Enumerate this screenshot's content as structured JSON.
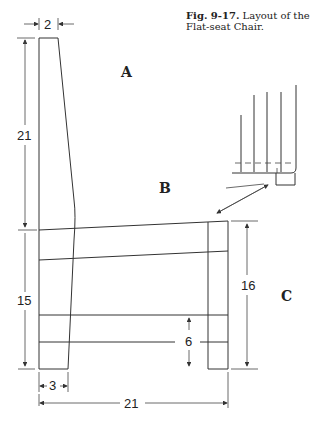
{
  "caption": {
    "figure": "Fig. 9-17.",
    "text": "Layout of the Flat-seat Chair."
  },
  "labels": {
    "back": "A",
    "seat": "B",
    "leg": "C"
  },
  "dimensions": {
    "back_top_width": "2",
    "back_height": "21",
    "seat_height_left": "15",
    "leg_height_right": "16",
    "stretcher_height": "6",
    "leg_bottom_width": "3",
    "seat_depth": "21"
  },
  "colors": {
    "line": "#333333",
    "text": "#222222",
    "background": "#ffffff"
  }
}
